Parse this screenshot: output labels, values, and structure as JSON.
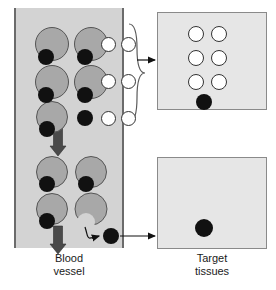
{
  "figure": {
    "type": "diagram"
  },
  "colors": {
    "vessel_fill": "#d3d3d3",
    "vessel_border": "#6b6b6b",
    "panel_fill": "#e6e6e6",
    "panel_border": "#8a8a8a",
    "carrier_fill": "#a8a8a8",
    "carrier_border": "#555555",
    "drug_fill": "#111111",
    "receptor_fill": "#ffffff",
    "receptor_border": "#333333",
    "arrow_flow": "#4a4a4a",
    "arrow_pointer": "#111111",
    "text": "#1a1a1a"
  },
  "labels": {
    "blood_vessel": "Blood\nvessel",
    "target_tissues": "Target\ntissues"
  },
  "vessel": {
    "x": 14,
    "y": 8,
    "width": 110,
    "height": 240,
    "bound_complexes": [
      {
        "cx": 38,
        "cy": 36,
        "r": 17,
        "drug_cx": 32,
        "drug_cy": 49,
        "drug_r": 8
      },
      {
        "cx": 77,
        "cy": 36,
        "r": 17,
        "drug_cx": 71,
        "drug_cy": 49,
        "drug_r": 8
      },
      {
        "cx": 38,
        "cy": 74,
        "r": 17,
        "drug_cx": 32,
        "drug_cy": 87,
        "drug_r": 8
      },
      {
        "cx": 77,
        "cy": 74,
        "r": 17,
        "drug_cx": 71,
        "drug_cy": 87,
        "drug_r": 8
      },
      {
        "cx": 38,
        "cy": 109,
        "r": 16,
        "drug_cx": 33,
        "drug_cy": 121,
        "drug_r": 8
      },
      {
        "cx": 38,
        "cy": 164,
        "r": 16,
        "drug_cx": 33,
        "drug_cy": 176,
        "drug_r": 8
      },
      {
        "cx": 77,
        "cy": 164,
        "r": 16,
        "drug_cx": 72,
        "drug_cy": 176,
        "drug_r": 8
      },
      {
        "cx": 38,
        "cy": 201,
        "r": 16,
        "drug_cx": 33,
        "drug_cy": 213,
        "drug_r": 8
      }
    ],
    "free_drugs": [
      {
        "cx": 71,
        "cy": 110,
        "r": 8
      },
      {
        "cx": 97,
        "cy": 228,
        "r": 8
      }
    ],
    "notched_carrier": {
      "cx": 77,
      "cy": 201,
      "r": 16,
      "notch_cx": 72,
      "notch_cy": 214,
      "notch_r": 9
    },
    "free_receptors": [
      {
        "cx": 94,
        "cy": 36,
        "r": 7.5
      },
      {
        "cx": 114,
        "cy": 36,
        "r": 7.5
      },
      {
        "cx": 94,
        "cy": 73,
        "r": 7.5
      },
      {
        "cx": 114,
        "cy": 73,
        "r": 7.5
      },
      {
        "cx": 94,
        "cy": 110,
        "r": 7.5
      },
      {
        "cx": 114,
        "cy": 110,
        "r": 7.5
      }
    ],
    "flow_arrows": [
      {
        "x": 44,
        "y_from": 120,
        "y_to": 148
      },
      {
        "x": 44,
        "y_from": 218,
        "y_to": 246
      }
    ]
  },
  "top_panel": {
    "x": 157,
    "y": 12,
    "width": 110,
    "height": 98,
    "receptors": [
      {
        "cx": 39,
        "cy": 22,
        "r": 8
      },
      {
        "cx": 62,
        "cy": 22,
        "r": 8
      },
      {
        "cx": 39,
        "cy": 46,
        "r": 8
      },
      {
        "cx": 62,
        "cy": 46,
        "r": 8
      },
      {
        "cx": 39,
        "cy": 70,
        "r": 8
      },
      {
        "cx": 62,
        "cy": 70,
        "r": 8
      }
    ],
    "drugs": [
      {
        "cx": 47,
        "cy": 90,
        "r": 8
      }
    ]
  },
  "bottom_panel": {
    "x": 157,
    "y": 157,
    "width": 110,
    "height": 92,
    "drugs": [
      {
        "cx": 47,
        "cy": 71,
        "r": 9
      }
    ]
  },
  "connectors": {
    "brace": {
      "x": 129,
      "y_top": 24,
      "y_bottom": 122,
      "label": "grouping-brace"
    },
    "brace_arrow": {
      "x_from": 137,
      "x_to": 155,
      "y": 60
    },
    "release_arrow": {
      "label": "curved-release-arrow"
    },
    "tissue_arrow": {
      "x_from": 106,
      "x_to": 155,
      "y": 228
    }
  },
  "captions": {
    "blood_vessel": {
      "x": 34,
      "y": 252,
      "width": 70
    },
    "target_tissues": {
      "x": 177,
      "y": 252,
      "width": 70
    }
  }
}
